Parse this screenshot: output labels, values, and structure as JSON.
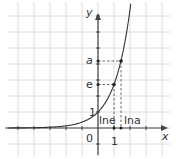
{
  "figure": {
    "function": "y = e^x",
    "axes": {
      "x_label": "x",
      "y_label": "y",
      "origin_label": "0"
    },
    "y_ticks_labeled": [
      {
        "value": 1,
        "label": "1"
      },
      {
        "value": 2.718,
        "label": "e"
      },
      {
        "value": 4.2,
        "label": "a"
      }
    ],
    "x_ticks_labeled": [
      {
        "value": 1,
        "label": "1"
      }
    ],
    "annotations": [
      {
        "x": 1,
        "label": "lne"
      },
      {
        "x": 1.43,
        "label": "lna"
      }
    ],
    "points": [
      {
        "x": 1,
        "y": 2.718,
        "name": "(1, e)"
      },
      {
        "x": 1.43,
        "y": 4.2,
        "name": "(ln a, a)"
      }
    ],
    "colors": {
      "grid": "#d9d9d9",
      "axis": "#444444",
      "curve": "#333333",
      "dashed": "#555555"
    }
  }
}
